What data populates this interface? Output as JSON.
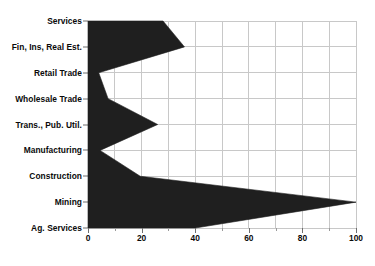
{
  "chart_data": {
    "type": "area",
    "orientation": "horizontal",
    "title": "",
    "subtitle": "",
    "xlabel": "",
    "ylabel": "",
    "categories": [
      "Services",
      "Fin, Ins, Real Est.",
      "Retail Trade",
      "Wholesale Trade",
      "Trans., Pub. Util.",
      "Manufacturing",
      "Construction",
      "Mining",
      "Ag. Services"
    ],
    "values": [
      28,
      36,
      4,
      7.5,
      26,
      4.5,
      19.5,
      100,
      40
    ],
    "xlim": [
      0,
      100
    ],
    "xticks": [
      0,
      20,
      40,
      60,
      80,
      100
    ],
    "xtick_labels": [
      "0",
      "20",
      "40",
      "60",
      "80",
      "100"
    ],
    "xminor_ticks": [
      10,
      30,
      50,
      70,
      90
    ],
    "grid": true,
    "grid_axis": "both",
    "legend": false,
    "legend_position": "none",
    "series": [
      {
        "name": "",
        "values": [
          28,
          36,
          4,
          7.5,
          26,
          4.5,
          19.5,
          100,
          40
        ]
      }
    ],
    "colors": {
      "fill": "#1f1f1f",
      "grid": "#c8c8c8",
      "axis": "#6f6f6f",
      "text": "#0a0a0a",
      "background": "#ffffff"
    }
  }
}
